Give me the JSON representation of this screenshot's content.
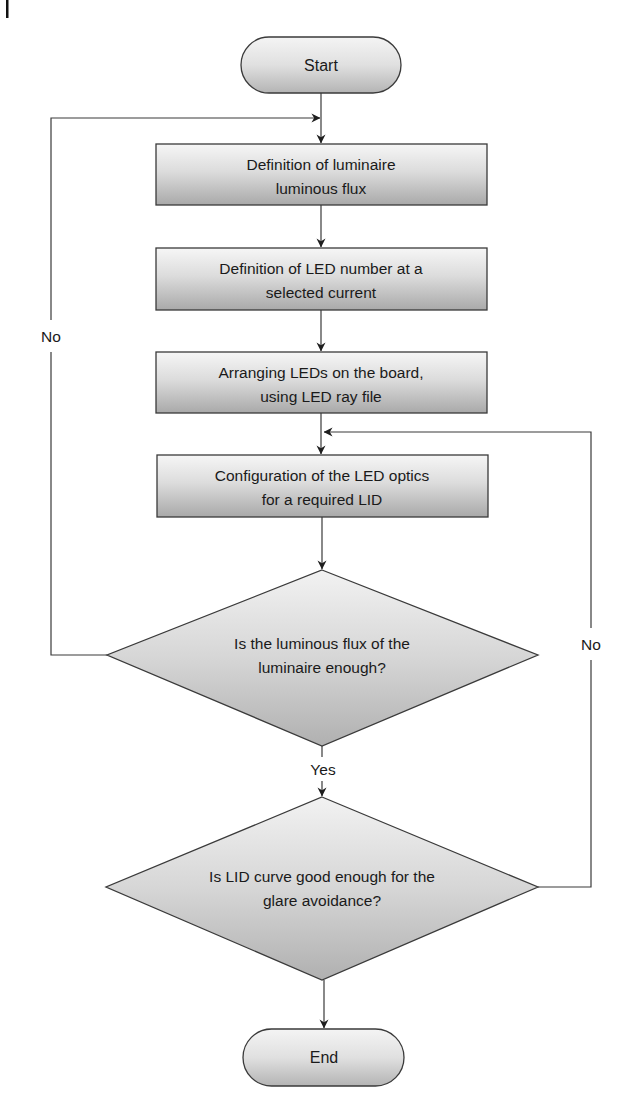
{
  "diagram": {
    "type": "flowchart",
    "colors": {
      "line": "#3a3a3a",
      "fill_top": "#f6f6f6",
      "fill_bottom": "#a9a9a9",
      "diamond_fill_top": "#f2f2f2",
      "diamond_fill_bottom": "#b0b0b0",
      "text": "#1a1a1a",
      "background": "#ffffff"
    },
    "start": {
      "label": "Start"
    },
    "end": {
      "label": "End"
    },
    "steps": [
      {
        "line1": "Definition of luminaire",
        "line2": "luminous flux"
      },
      {
        "line1": "Definition of LED number at a",
        "line2": "selected current"
      },
      {
        "line1": "Arranging LEDs on the board,",
        "line2": "using LED ray file"
      },
      {
        "line1": "Configuration of the LED optics",
        "line2": "for a required LID"
      }
    ],
    "decisions": [
      {
        "line1": "Is the luminous flux of the",
        "line2": "luminaire enough?",
        "yes_label": "Yes",
        "no_label": "No"
      },
      {
        "line1": "Is LID curve good enough for the",
        "line2": "glare avoidance?",
        "no_label": "No"
      }
    ],
    "edges": [
      {
        "from": "Start",
        "to": "step-1"
      },
      {
        "from": "step-1",
        "to": "step-2"
      },
      {
        "from": "step-2",
        "to": "step-3"
      },
      {
        "from": "step-3",
        "to": "step-4"
      },
      {
        "from": "step-4",
        "to": "decision-1"
      },
      {
        "from": "decision-1",
        "to": "step-1",
        "label": "No"
      },
      {
        "from": "decision-1",
        "to": "decision-2",
        "label": "Yes"
      },
      {
        "from": "decision-2",
        "to": "step-4",
        "label": "No"
      },
      {
        "from": "decision-2",
        "to": "End"
      }
    ]
  }
}
